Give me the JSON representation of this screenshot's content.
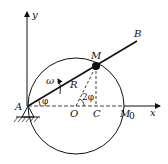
{
  "diagram": {
    "type": "mechanism",
    "labels": {
      "y_axis": "y",
      "x_axis": "x",
      "pivot": "A",
      "rod_end": "B",
      "point": "M",
      "center": "O",
      "foot": "C",
      "start_point": "M",
      "start_point_sub": "0",
      "radius": "R",
      "angle_phi": "φ",
      "angle_2phi": "2φ",
      "angular_velocity": "ω"
    },
    "colors": {
      "stroke": "#111111",
      "background": "#ffffff"
    }
  }
}
